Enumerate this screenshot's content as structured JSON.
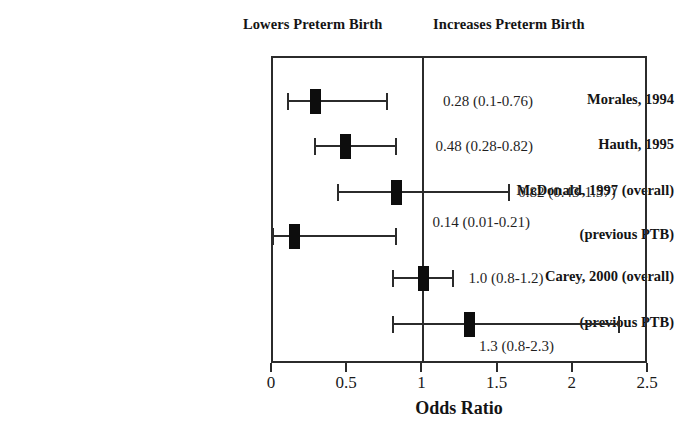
{
  "headers": {
    "left": "Lowers Preterm Birth",
    "right": "Increases Preterm Birth"
  },
  "axis": {
    "title": "Odds Ratio",
    "min": 0,
    "max": 2.5,
    "ticks": [
      {
        "value": 0,
        "label": "0"
      },
      {
        "value": 0.5,
        "label": "0.5"
      },
      {
        "value": 1,
        "label": "1"
      },
      {
        "value": 1.5,
        "label": "1.5"
      },
      {
        "value": 2,
        "label": "2"
      },
      {
        "value": 2.5,
        "label": "2.5"
      }
    ],
    "reference_line": 1
  },
  "chart_data": {
    "type": "scatter",
    "title": "",
    "subtitle": "",
    "xlabel": "Odds Ratio",
    "ylabel": "",
    "xlim": [
      0,
      2.5
    ],
    "grid": false,
    "legend": "none",
    "reference_line": 1,
    "annotations": [
      "Lowers Preterm Birth",
      "Increases Preterm Birth"
    ],
    "categories": [
      "Morales, 1994",
      "Hauth, 1995",
      "McDonald, 1997 (overall)",
      "(previous PTB)",
      "Carey, 2000 (overall)",
      "(previous PTB)"
    ],
    "values": [
      0.28,
      0.48,
      0.82,
      0.14,
      1.0,
      1.3
    ],
    "ci_low": [
      0.1,
      0.28,
      0.43,
      0.01,
      0.8,
      0.8
    ],
    "ci_high": [
      0.76,
      0.82,
      1.57,
      0.21,
      1.2,
      2.3
    ],
    "value_labels": [
      "0.28 (0.1-0.76)",
      "0.48 (0.28-0.82)",
      "0.82 (0.43-1.57)",
      "0.14 (0.01-0.21)",
      "1.0 (0.8-1.2)",
      "1.3 (0.8-2.3)"
    ]
  },
  "rows": [
    {
      "label": "Morales, 1994",
      "estimate": 0.28,
      "ci_low": 0.1,
      "ci_high": 0.76,
      "value_label": "0.28 (0.1-0.76)",
      "y": 99,
      "draw_low": 0.1,
      "draw_high": 0.76,
      "label_x": 1.13,
      "label_y_offset": 0
    },
    {
      "label": "Hauth, 1995",
      "estimate": 0.48,
      "ci_low": 0.28,
      "ci_high": 0.82,
      "value_label": "0.48 (0.28-0.82)",
      "y": 144,
      "draw_low": 0.28,
      "draw_high": 0.82,
      "label_x": 1.08,
      "label_y_offset": 0
    },
    {
      "label": "McDonald, 1997 (overall)",
      "estimate": 0.82,
      "ci_low": 0.43,
      "ci_high": 1.57,
      "value_label": "0.82 (0.43-1.57)",
      "y": 190,
      "draw_low": 0.43,
      "draw_high": 1.57,
      "label_x": 1.63,
      "label_y_offset": 0
    },
    {
      "label": "(previous PTB)",
      "estimate": 0.14,
      "ci_low": 0.01,
      "ci_high": 0.21,
      "value_label": "0.14 (0.01-0.21)",
      "y": 234,
      "draw_low": 0.0,
      "draw_high": 0.82,
      "label_x": 1.06,
      "label_y_offset": -14
    },
    {
      "label": "Carey, 2000 (overall)",
      "estimate": 1.0,
      "ci_low": 0.8,
      "ci_high": 1.2,
      "value_label": "1.0 (0.8-1.2)",
      "y": 276,
      "draw_low": 0.8,
      "draw_high": 1.2,
      "label_x": 1.3,
      "label_y_offset": 0
    },
    {
      "label": "(previous PTB)",
      "estimate": 1.3,
      "ci_low": 0.8,
      "ci_high": 2.3,
      "value_label": "1.3 (0.8-2.3)",
      "y": 322,
      "draw_low": 0.8,
      "draw_high": 2.3,
      "label_x": 1.37,
      "label_y_offset": 22
    }
  ]
}
